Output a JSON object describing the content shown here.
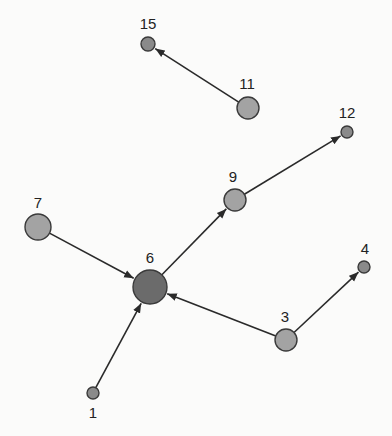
{
  "diagram": {
    "type": "directed-graph",
    "colors": {
      "background": "#fbfbfa",
      "edge": "#2a2a2a",
      "node_stroke": "#3a3a3a",
      "node_fill_default": "#a3a3a3",
      "node_fill_small": "#8a8a8a",
      "node_fill_hub": "#6b6b6b",
      "label": "#222222"
    },
    "nodes": [
      {
        "id": "1",
        "label": "1",
        "x": 93,
        "y": 393,
        "r": 6,
        "fill": "#8a8a8a",
        "label_x": 93,
        "label_y": 418
      },
      {
        "id": "3",
        "label": "3",
        "x": 286,
        "y": 340,
        "r": 11,
        "fill": "#a3a3a3",
        "label_x": 285,
        "label_y": 322
      },
      {
        "id": "4",
        "label": "4",
        "x": 364,
        "y": 267,
        "r": 6,
        "fill": "#8a8a8a",
        "label_x": 365,
        "label_y": 254
      },
      {
        "id": "6",
        "label": "6",
        "x": 150,
        "y": 287,
        "r": 17,
        "fill": "#6b6b6b",
        "label_x": 150,
        "label_y": 263
      },
      {
        "id": "7",
        "label": "7",
        "x": 38,
        "y": 227,
        "r": 13,
        "fill": "#a3a3a3",
        "label_x": 38,
        "label_y": 208
      },
      {
        "id": "9",
        "label": "9",
        "x": 235,
        "y": 200,
        "r": 11,
        "fill": "#a3a3a3",
        "label_x": 233,
        "label_y": 182
      },
      {
        "id": "11",
        "label": "11",
        "x": 248,
        "y": 108,
        "r": 11,
        "fill": "#a3a3a3",
        "label_x": 247,
        "label_y": 89
      },
      {
        "id": "12",
        "label": "12",
        "x": 347,
        "y": 132,
        "r": 6,
        "fill": "#8a8a8a",
        "label_x": 347,
        "label_y": 118
      },
      {
        "id": "15",
        "label": "15",
        "x": 148,
        "y": 44,
        "r": 7,
        "fill": "#8a8a8a",
        "label_x": 148,
        "label_y": 29
      }
    ],
    "edges": [
      {
        "from": "11",
        "to": "15"
      },
      {
        "from": "9",
        "to": "12"
      },
      {
        "from": "6",
        "to": "9"
      },
      {
        "from": "7",
        "to": "6"
      },
      {
        "from": "3",
        "to": "6"
      },
      {
        "from": "3",
        "to": "4"
      },
      {
        "from": "1",
        "to": "6"
      }
    ]
  }
}
